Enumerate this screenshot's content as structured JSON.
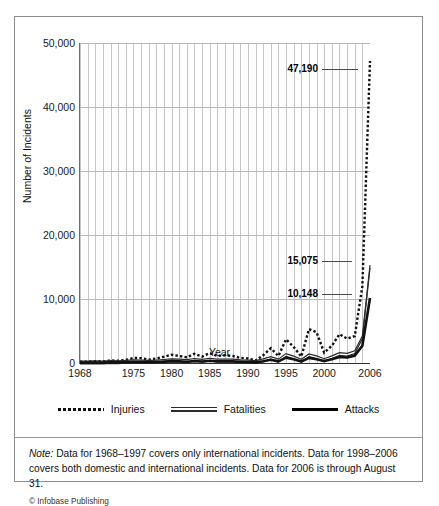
{
  "chart_data": {
    "type": "line",
    "title": "",
    "xlabel": "Year",
    "ylabel": "Number of Incidents",
    "xlim": [
      1968,
      2006
    ],
    "ylim": [
      0,
      50000
    ],
    "grid": true,
    "legend_position": "bottom",
    "ytick_labels": [
      "0",
      "10,000",
      "20,000",
      "30,000",
      "40,000",
      "50,000"
    ],
    "ytick_values": [
      0,
      10000,
      20000,
      30000,
      40000,
      50000
    ],
    "xtick_labels": [
      "1968",
      "1975",
      "1980",
      "1985",
      "1990",
      "1995",
      "2000",
      "2006"
    ],
    "xtick_values": [
      1968,
      1975,
      1980,
      1985,
      1990,
      1995,
      2000,
      2006
    ],
    "x": [
      1968,
      1969,
      1970,
      1971,
      1972,
      1973,
      1974,
      1975,
      1976,
      1977,
      1978,
      1979,
      1980,
      1981,
      1982,
      1983,
      1984,
      1985,
      1986,
      1987,
      1988,
      1989,
      1990,
      1991,
      1992,
      1993,
      1994,
      1995,
      1996,
      1997,
      1998,
      1999,
      2000,
      2001,
      2002,
      2003,
      2004,
      2005,
      2006
    ],
    "series": [
      {
        "name": "Injuries",
        "style": "dotted",
        "end_label": "47,190",
        "values": [
          190,
          210,
          290,
          230,
          410,
          340,
          480,
          780,
          760,
          520,
          700,
          980,
          1300,
          1100,
          900,
          1450,
          1000,
          1550,
          1100,
          1200,
          1100,
          800,
          700,
          400,
          1200,
          2300,
          1100,
          3700,
          2500,
          1000,
          5300,
          4800,
          1600,
          2700,
          4500,
          3800,
          4200,
          12000,
          47190
        ]
      },
      {
        "name": "Fatalities",
        "style": "double",
        "end_label": "15,075",
        "values": [
          60,
          80,
          110,
          90,
          150,
          130,
          180,
          260,
          250,
          190,
          240,
          330,
          430,
          380,
          300,
          480,
          340,
          520,
          380,
          410,
          380,
          280,
          250,
          150,
          420,
          780,
          380,
          1250,
          850,
          350,
          1200,
          900,
          450,
          900,
          1400,
          1300,
          1700,
          4000,
          15075
        ]
      },
      {
        "name": "Attacks",
        "style": "solid",
        "end_label": "10,148",
        "values": [
          40,
          55,
          75,
          60,
          100,
          90,
          120,
          175,
          170,
          130,
          165,
          220,
          290,
          255,
          200,
          320,
          230,
          350,
          255,
          275,
          255,
          190,
          170,
          100,
          280,
          520,
          255,
          840,
          570,
          235,
          800,
          600,
          300,
          600,
          940,
          870,
          1150,
          2700,
          10148
        ]
      }
    ]
  },
  "legend": [
    {
      "label": "Injuries",
      "style": "dotted"
    },
    {
      "label": "Fatalities",
      "style": "double"
    },
    {
      "label": "Attacks",
      "style": "solid"
    }
  ],
  "note": {
    "prefix": "Note:",
    "text": " Data for 1968–1997 covers only international incidents. Data for 1998–2006 covers both domestic and international incidents. Data for 2006 is through August 31.",
    "credit": "© Infobase Publishing"
  },
  "colors": {
    "ink": "#111111",
    "grid": "#c6c6c6",
    "axis": "#333333",
    "frame": "#8e8e8e"
  }
}
